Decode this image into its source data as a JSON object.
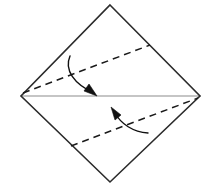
{
  "figure": {
    "kind": "origami-fold-diagram",
    "canvas": {
      "width": 217,
      "height": 185
    },
    "background_color": "#ffffff"
  },
  "colors": {
    "outline": "#2b2b2b",
    "center_line": "#b3b3b3",
    "fold_line": "#1a1a1a",
    "arrow": "#111111",
    "background": "#ffffff"
  },
  "shapes": {
    "square_outline": {
      "name": "rotated-square",
      "stroke_width": 1.6,
      "vertices": [
        {
          "label": "top",
          "x": 110,
          "y": 5
        },
        {
          "label": "right",
          "x": 200,
          "y": 96
        },
        {
          "label": "bottom",
          "x": 110,
          "y": 182
        },
        {
          "label": "left",
          "x": 21,
          "y": 96
        }
      ],
      "points_attr": "110,5 200,96 110,182 21,96"
    },
    "center_line": {
      "name": "horizontal-diagonal",
      "stroke_width": 1.4,
      "x1": 21,
      "y1": 96,
      "x2": 200,
      "y2": 96
    },
    "fold_line_upper": {
      "name": "upper-valley-fold",
      "stroke_width": 1.5,
      "dash_pattern": "7 5",
      "x1": 23,
      "y1": 93,
      "x2": 150,
      "y2": 45
    },
    "fold_line_lower": {
      "name": "lower-valley-fold",
      "stroke_width": 1.5,
      "dash_pattern": "7 5",
      "x1": 71,
      "y1": 146,
      "x2": 198,
      "y2": 98
    },
    "arrow_upper": {
      "name": "fold-down-arrow",
      "stroke_width": 1.4,
      "path_d": "M 70,56 C 64,70 74,84 94,93",
      "head_points": "96,95 85,90 89,85"
    },
    "arrow_lower": {
      "name": "fold-up-arrow",
      "stroke_width": 1.4,
      "path_d": "M 148,133 C 133,132 121,124 115,113",
      "head_points": "112,109 123,114 118,119"
    }
  },
  "labels": {
    "alt_text": "A square sheet of paper shown rotated 45 degrees as a diamond. A light gray horizontal line runs between the left and right corners. Two parallel dashed valley fold lines are drawn, one in the upper half and one in the lower half. A curved arrow points downward onto the center line from the upper fold, and a curved arrow points upward toward the center line from the lower fold.",
    "caption": ""
  }
}
